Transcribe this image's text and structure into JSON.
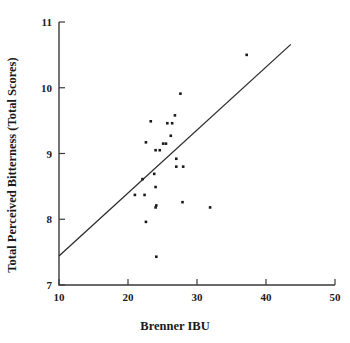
{
  "chart_data": {
    "type": "scatter",
    "title": "",
    "xlabel": "Brenner IBU",
    "ylabel": "Total Perceived Bitterness (Total Scores)",
    "xlim": [
      10,
      50
    ],
    "ylim": [
      7,
      11
    ],
    "xticks": [
      10,
      20,
      30,
      40,
      50
    ],
    "yticks": [
      7,
      8,
      9,
      10,
      11
    ],
    "xtick_labels": [
      "10",
      "20",
      "30",
      "40",
      "50"
    ],
    "ytick_labels": [
      "7",
      "8",
      "9",
      "10",
      "11"
    ],
    "grid": false,
    "legend": null,
    "marker": "square",
    "marker_color": "#1a1a1a",
    "x": [
      21.0,
      22.1,
      22.4,
      22.6,
      22.6,
      23.3,
      23.8,
      24.0,
      24.0,
      24.0,
      24.1,
      24.1,
      24.6,
      25.1,
      25.5,
      25.7,
      26.2,
      26.4,
      26.8,
      27.0,
      27.0,
      27.6,
      27.9,
      28.0,
      31.9,
      37.2
    ],
    "y": [
      8.37,
      8.61,
      8.37,
      7.96,
      9.17,
      9.49,
      8.69,
      9.05,
      8.49,
      8.18,
      7.43,
      8.21,
      9.05,
      9.15,
      9.15,
      9.46,
      9.27,
      9.46,
      9.58,
      8.92,
      8.8,
      9.91,
      8.26,
      8.8,
      8.18,
      10.5
    ],
    "series": [
      {
        "name": "observations",
        "points": [
          [
            21.0,
            8.37
          ],
          [
            22.1,
            8.61
          ],
          [
            22.4,
            8.37
          ],
          [
            22.6,
            7.96
          ],
          [
            22.6,
            9.17
          ],
          [
            23.3,
            9.49
          ],
          [
            23.8,
            8.69
          ],
          [
            24.0,
            9.05
          ],
          [
            24.0,
            8.49
          ],
          [
            24.0,
            8.18
          ],
          [
            24.1,
            7.43
          ],
          [
            24.1,
            8.21
          ],
          [
            24.6,
            9.05
          ],
          [
            25.1,
            9.15
          ],
          [
            25.5,
            9.15
          ],
          [
            25.7,
            9.46
          ],
          [
            26.2,
            9.27
          ],
          [
            26.4,
            9.46
          ],
          [
            26.8,
            9.58
          ],
          [
            27.0,
            8.92
          ],
          [
            27.0,
            8.8
          ],
          [
            27.6,
            9.91
          ],
          [
            27.9,
            8.26
          ],
          [
            28.0,
            8.8
          ],
          [
            31.9,
            8.18
          ],
          [
            37.2,
            10.5
          ]
        ]
      }
    ],
    "fit_line": {
      "name": "regression-line",
      "x0": 10.0,
      "y0": 7.44,
      "x1": 43.6,
      "y1": 10.66
    },
    "annotations": []
  }
}
